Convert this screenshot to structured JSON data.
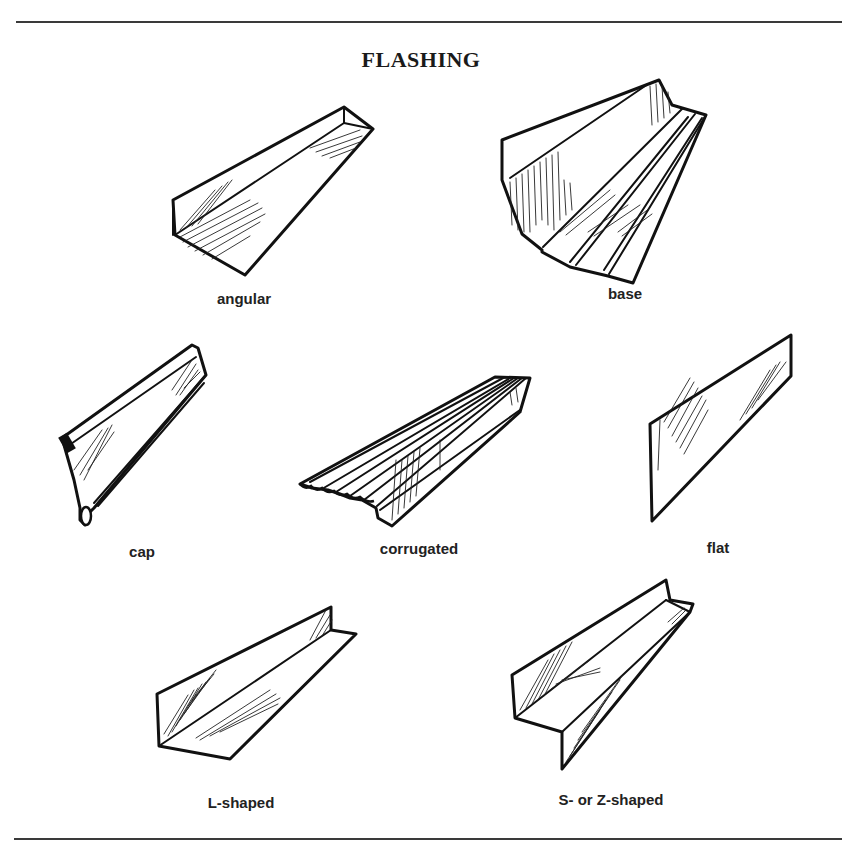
{
  "title": "FLASHING",
  "figures": [
    {
      "id": "angular",
      "label": "angular"
    },
    {
      "id": "base",
      "label": "base"
    },
    {
      "id": "cap",
      "label": "cap"
    },
    {
      "id": "corrugated",
      "label": "corrugated"
    },
    {
      "id": "flat",
      "label": "flat"
    },
    {
      "id": "l-shaped",
      "label": "L-shaped"
    },
    {
      "id": "s-z-shaped",
      "label": "S- or Z-shaped"
    }
  ],
  "colors": {
    "ink": "#111111",
    "background": "#ffffff",
    "rule": "#3a3a3a"
  }
}
